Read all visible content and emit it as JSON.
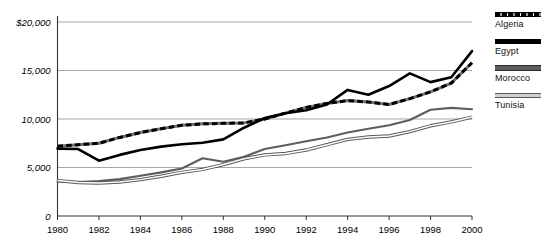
{
  "chart_data": {
    "type": "line",
    "title": "",
    "xlabel": "",
    "ylabel": "",
    "x": [
      1980,
      1981,
      1982,
      1983,
      1984,
      1985,
      1986,
      1987,
      1988,
      1989,
      1990,
      1991,
      1992,
      1993,
      1994,
      1995,
      1996,
      1997,
      1998,
      1999,
      2000
    ],
    "xlim": [
      1980,
      2000
    ],
    "ylim": [
      0,
      20000
    ],
    "yticks": [
      0,
      5000,
      10000,
      15000,
      20000
    ],
    "ytick_labels": [
      "0",
      "5,000",
      "10,000",
      "15,000",
      "$20,000"
    ],
    "xticks": [
      1980,
      1982,
      1984,
      1986,
      1988,
      1990,
      1992,
      1994,
      1996,
      1998,
      2000
    ],
    "xtick_labels": [
      "1980",
      "1982",
      "1984",
      "1986",
      "1988",
      "1990",
      "1992",
      "1994",
      "1996",
      "1998",
      "2000"
    ],
    "grid": true,
    "grid_axis": "y",
    "legend_position": "right",
    "series": [
      {
        "name": "Algeria",
        "style": "dashed",
        "color": "#000000",
        "values": [
          7200,
          7350,
          7500,
          8100,
          8600,
          9000,
          9350,
          9500,
          9550,
          9600,
          10000,
          10600,
          11200,
          11600,
          11900,
          11750,
          11500,
          12100,
          12800,
          13700,
          15800
        ]
      },
      {
        "name": "Egypt",
        "style": "solid-thick",
        "color": "#000000",
        "values": [
          6950,
          6900,
          5700,
          6300,
          6800,
          7150,
          7400,
          7550,
          7900,
          9100,
          10100,
          10600,
          10900,
          11500,
          13000,
          12500,
          13400,
          14700,
          13800,
          14300,
          17000
        ]
      },
      {
        "name": "Morocco",
        "style": "solid-medium",
        "color": "#5d5d5d",
        "values": [
          3550,
          3500,
          3600,
          3800,
          4150,
          4500,
          4900,
          5950,
          5600,
          6100,
          6900,
          7300,
          7700,
          8100,
          8600,
          9000,
          9350,
          9900,
          10950,
          11150,
          11000
        ]
      },
      {
        "name": "Tunisia",
        "style": "double",
        "color": "#8a8a8a",
        "values": [
          3650,
          3450,
          3400,
          3500,
          3750,
          4100,
          4500,
          4800,
          5300,
          5900,
          6300,
          6450,
          6800,
          7350,
          7900,
          8150,
          8250,
          8700,
          9300,
          9700,
          10200
        ]
      }
    ]
  },
  "legend": {
    "items": [
      {
        "label": "Algeria",
        "swatch": "algeria-line-swatch"
      },
      {
        "label": "Egypt",
        "swatch": "egypt-line-swatch"
      },
      {
        "label": "Morocco",
        "swatch": "morocco-line-swatch"
      },
      {
        "label": "Tunisia",
        "swatch": "tunisia-line-swatch"
      }
    ]
  }
}
